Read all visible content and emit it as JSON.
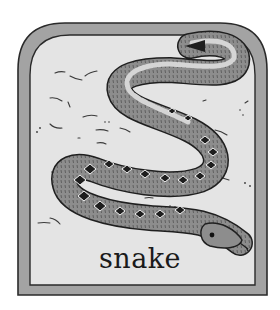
{
  "card": {
    "word": "snake",
    "subject": "snake-illustration",
    "colors": {
      "frame_outer": "#9e9e9e",
      "frame_inner": "#e6e6e6",
      "border_line": "#2a2a2a",
      "snake_body": "#8a8a8a",
      "snake_light": "#d2d2d2",
      "snake_pattern": "#1e1e1e"
    }
  }
}
